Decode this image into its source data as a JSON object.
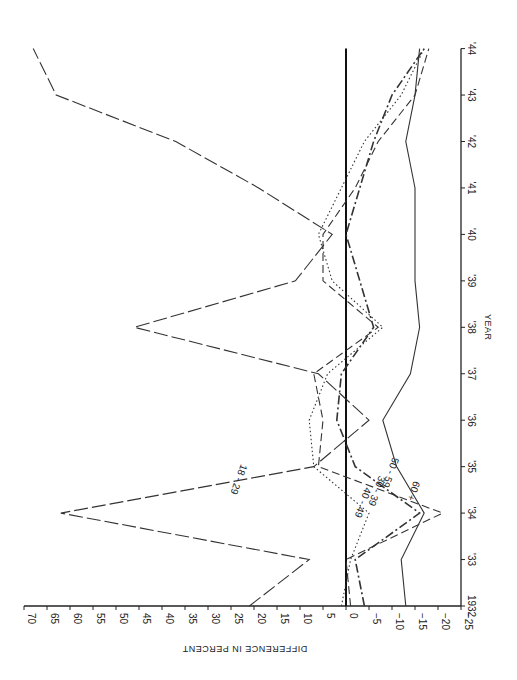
{
  "chart_data": {
    "type": "line",
    "orientation": "rotated-90",
    "title": "",
    "xlabel": "YEAR",
    "ylabel": "DIFFERENCE IN PERCENT",
    "x": [
      1932,
      1933,
      1934,
      1935,
      1936,
      1937,
      1938,
      1939,
      1940,
      1941,
      1942,
      1943,
      1944
    ],
    "x_tick_labels": [
      "1932",
      "'33",
      "'34",
      "'35",
      "'36",
      "'37",
      "'38",
      "'39",
      "'40",
      "'41",
      "'42",
      "'43",
      "'44"
    ],
    "y_ticks": [
      70,
      65,
      60,
      55,
      50,
      45,
      40,
      35,
      30,
      25,
      20,
      15,
      10,
      5,
      0,
      -5,
      -10,
      -15,
      -20,
      -25
    ],
    "y_tick_labels": [
      "70",
      "65",
      "60",
      "55",
      "50",
      "45",
      "40",
      "35",
      "30",
      "25",
      "20",
      "15",
      "10",
      "5",
      "0",
      "−5",
      "−10",
      "−15",
      "−20",
      "−25"
    ],
    "ylim": [
      -25,
      70
    ],
    "grid": false,
    "reference_line": 0,
    "series": [
      {
        "name": "18-29",
        "style": "long-dash",
        "values": [
          21,
          8,
          62,
          7,
          -5,
          6,
          46,
          11,
          3,
          19,
          37,
          63,
          68
        ]
      },
      {
        "name": "30-39",
        "style": "dash",
        "values": [
          -1,
          0,
          -21,
          6,
          5,
          7,
          -7,
          5,
          5,
          -2,
          -7,
          -15,
          -18
        ]
      },
      {
        "name": "40-49",
        "style": "dotted",
        "values": [
          1,
          -1,
          -5,
          7,
          8,
          4,
          -8,
          3,
          6,
          1,
          -4,
          -12,
          -17
        ]
      },
      {
        "name": "50-59",
        "style": "dash-dot",
        "values": [
          -4,
          -2,
          -16,
          -2,
          2,
          1,
          -6,
          -3,
          0,
          -3,
          -6,
          -10,
          -17
        ]
      },
      {
        "name": "60+",
        "style": "solid",
        "values": [
          -13,
          -12,
          -17,
          -11,
          -8,
          -14,
          -16,
          -15,
          -15,
          -15,
          -13,
          -15,
          -16
        ]
      }
    ],
    "series_labels": [
      {
        "text": "18 - 29",
        "year": 1934.75,
        "value": 24
      },
      {
        "text": "30 - 39",
        "year": 1934.5,
        "value": -6
      },
      {
        "text": "40 - 49",
        "year": 1934.25,
        "value": -3
      },
      {
        "text": "50 - 59",
        "year": 1934.9,
        "value": -9
      },
      {
        "text": "60 +",
        "year": 1934.5,
        "value": -14
      }
    ]
  }
}
